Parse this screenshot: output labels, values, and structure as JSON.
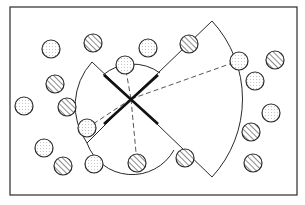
{
  "diagram": {
    "type": "coverage-sectors",
    "frame": {
      "x": 10,
      "y": 7,
      "width": 287,
      "height": 188
    },
    "colors": {
      "stroke": "#2a2a2a",
      "background": "#ffffff",
      "dot": "#8a8a8a"
    },
    "center": {
      "x": 131,
      "y": 99
    },
    "cross_lines": [
      {
        "x1": 104,
        "y1": 75,
        "x2": 158,
        "y2": 124
      },
      {
        "x1": 104,
        "y1": 124,
        "x2": 158,
        "y2": 75
      }
    ],
    "sectors": [
      {
        "name": "left-sector",
        "apex_top": {
          "x": 92,
          "y": 62
        },
        "apex_bottom": {
          "x": 87,
          "y": 143
        },
        "arc_path": "M92,62 L131,99 L87,143 A65,65 0 0 1 92,62 Z"
      },
      {
        "name": "small-top-arc",
        "arc_path": "M103,75 A46,46 0 0 1 160,73"
      },
      {
        "name": "small-bottom-arc",
        "arc_path": "M87,143 A48,48 0 0 0 174,150"
      },
      {
        "name": "right-sector",
        "apex_top": {
          "x": 212,
          "y": 21
        },
        "apex_bottom": {
          "x": 212,
          "y": 177
        },
        "arc_path": "M212,21 L131,99 L212,177 A115,115 0 0 0 212,21 Z"
      }
    ],
    "dashed_lines": [
      {
        "x1": 131,
        "y1": 99,
        "x2": 238,
        "y2": 61
      },
      {
        "x1": 131,
        "y1": 99,
        "x2": 87,
        "y2": 128
      },
      {
        "x1": 131,
        "y1": 99,
        "x2": 125,
        "y2": 65
      },
      {
        "x1": 131,
        "y1": 99,
        "x2": 137,
        "y2": 163
      }
    ],
    "markers": [
      {
        "type": "dotted",
        "x": 51,
        "y": 49
      },
      {
        "type": "hatched",
        "x": 93,
        "y": 43
      },
      {
        "type": "dotted",
        "x": 148,
        "y": 48
      },
      {
        "type": "dotted",
        "x": 125,
        "y": 65
      },
      {
        "type": "hatched",
        "x": 189,
        "y": 44
      },
      {
        "type": "dotted",
        "x": 239,
        "y": 61
      },
      {
        "type": "hatched",
        "x": 275,
        "y": 60
      },
      {
        "type": "dotted",
        "x": 255,
        "y": 81
      },
      {
        "type": "hatched",
        "x": 55,
        "y": 84
      },
      {
        "type": "dotted",
        "x": 24,
        "y": 106
      },
      {
        "type": "hatched",
        "x": 67,
        "y": 107
      },
      {
        "type": "dotted",
        "x": 271,
        "y": 113
      },
      {
        "type": "dotted",
        "x": 87,
        "y": 128
      },
      {
        "type": "hatched",
        "x": 251,
        "y": 132
      },
      {
        "type": "dotted",
        "x": 44,
        "y": 148
      },
      {
        "type": "hatched",
        "x": 185,
        "y": 158
      },
      {
        "type": "hatched",
        "x": 63,
        "y": 166
      },
      {
        "type": "dotted",
        "x": 94,
        "y": 164
      },
      {
        "type": "hatched",
        "x": 137,
        "y": 163
      },
      {
        "type": "hatched",
        "x": 253,
        "y": 163
      }
    ],
    "marker_radius": 9
  }
}
